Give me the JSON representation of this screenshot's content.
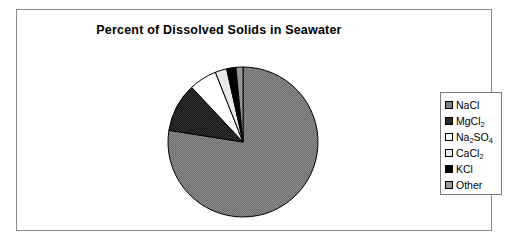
{
  "chart_data": {
    "type": "pie",
    "title": "Percent of Dissolved Solids in Seawater",
    "xlabel": "",
    "ylabel": "",
    "legend_position": "right",
    "grid": false,
    "start_angle_deg": 0,
    "direction": "clockwise",
    "categories": [
      "NaCl",
      "MgCl2",
      "Na2SO4",
      "CaCl2",
      "KCl",
      "Other"
    ],
    "values": [
      77.5,
      10.5,
      6.0,
      2.5,
      2.0,
      1.5
    ],
    "colors": [
      "#808080",
      "#2b2b2b",
      "#ffffff",
      "#d9d9d9",
      "#000000",
      "#9a9a9a"
    ],
    "slices": [
      {
        "label": "NaCl",
        "label_html": "NaCl",
        "value": 77.5,
        "color": "#808080",
        "swatch": "gray"
      },
      {
        "label": "MgCl2",
        "label_html": "MgCl<sub>2</sub>",
        "value": 10.5,
        "color": "#2b2b2b",
        "swatch": "dark-gray"
      },
      {
        "label": "Na2SO4",
        "label_html": "Na<sub>2</sub>SO<sub>4</sub>",
        "value": 6.0,
        "color": "#ffffff",
        "swatch": "white"
      },
      {
        "label": "CaCl2",
        "label_html": "CaCl<sub>2</sub>",
        "value": 2.5,
        "color": "#e8e8e8",
        "swatch": "light-gray"
      },
      {
        "label": "KCl",
        "label_html": "KCl",
        "value": 2.0,
        "color": "#000000",
        "swatch": "black"
      },
      {
        "label": "Other",
        "label_html": "Other",
        "value": 1.5,
        "color": "#9a9a9a",
        "swatch": "mid-gray"
      }
    ]
  },
  "legend": {
    "items": [
      {
        "label_html": "NaCl",
        "color": "#808080"
      },
      {
        "label_html": "MgCl<sub>2</sub>",
        "color": "#2b2b2b"
      },
      {
        "label_html": "Na<sub>2</sub>SO<sub>4</sub>",
        "color": "#ffffff"
      },
      {
        "label_html": "CaCl<sub>2</sub>",
        "color": "#e8e8e8"
      },
      {
        "label_html": "KCl",
        "color": "#000000"
      },
      {
        "label_html": "Other",
        "color": "#9a9a9a"
      }
    ]
  },
  "style": {
    "frame_border": "#8a8a8a",
    "slice_outline": "#000000",
    "background": "#ffffff",
    "text_color": "#000000"
  }
}
